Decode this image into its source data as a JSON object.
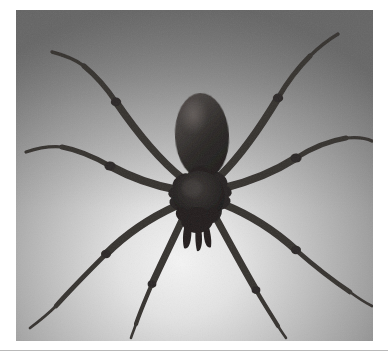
{
  "page": {
    "background_color": "#ffffff",
    "width": 388,
    "height": 358
  },
  "photo": {
    "subject": "spider",
    "common_name": "Brown recluse spider",
    "alt_text": "Grayscale photograph of a long-legged spider with an oval abdomen, viewed from above on a plain gradient background",
    "color_mode": "grayscale",
    "frame": {
      "x": 16,
      "y": 10,
      "width": 357,
      "height": 331,
      "border_color": "#ffffff"
    },
    "background": {
      "type": "radial-gradient",
      "highlight_color": "#f2f2f2",
      "mid_color": "#a8a8a8",
      "edge_color": "#6e6e6e",
      "highlight_center_x_pct": 46,
      "highlight_center_y_pct": 76
    },
    "body": {
      "abdomen_color": "#2e2b2a",
      "cephalothorax_color": "#232020",
      "leg_color": "#3a3634",
      "leg_count": 8,
      "abdomen": {
        "cx": 186,
        "cy": 125,
        "rx": 27,
        "ry": 42,
        "rotation_deg": -3
      },
      "cephalothorax": {
        "cx": 182,
        "cy": 183,
        "rx": 26,
        "ry": 26
      },
      "pedipalps": {
        "cx": 181,
        "cy": 213,
        "rx": 14,
        "ry": 16
      }
    },
    "legs": [
      {
        "id": "leg-left-1",
        "side": "left",
        "index": 1,
        "path": "M 166 168 C 140 150 110 118 84 78 C 76 66 62 56 50 50"
      },
      {
        "id": "leg-left-2",
        "side": "left",
        "index": 2,
        "path": "M 162 180 C 136 176 108 168 84 152 C 70 143 46 135 28 133"
      },
      {
        "id": "leg-left-3",
        "side": "left",
        "index": 3,
        "path": "M 160 196 C 134 204 106 220 84 244 C 72 257 50 278 36 296"
      },
      {
        "id": "leg-left-4",
        "side": "left",
        "index": 4,
        "path": "M 166 206 C 156 232 142 260 130 286 C 124 299 118 312 114 322"
      }
    ],
    "legs_right": [
      {
        "id": "leg-right-1",
        "side": "right",
        "index": 1,
        "path": "M 205 165 C 226 142 248 110 268 76 C 276 62 290 48 302 40"
      },
      {
        "id": "leg-right-2",
        "side": "right",
        "index": 2,
        "path": "M 208 178 C 234 172 260 162 282 146 C 296 136 322 128 342 128"
      },
      {
        "id": "leg-right-3",
        "side": "right",
        "index": 3,
        "path": "M 207 194 C 234 202 262 216 286 238 C 300 250 324 268 342 282"
      },
      {
        "id": "leg-right-4",
        "side": "right",
        "index": 4,
        "path": "M 200 208 C 212 234 226 262 240 288 C 248 302 256 314 262 324"
      }
    ]
  },
  "separator": {
    "color": "#b9b9b9",
    "thickness_px": 1,
    "y": 350
  }
}
